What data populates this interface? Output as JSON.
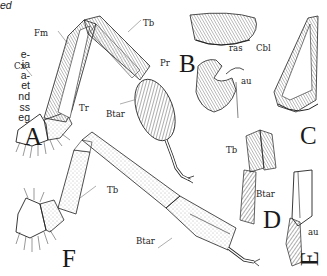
{
  "figure": {
    "side_text_fragments": [
      "ed",
      "",
      "e-",
      "ia",
      "a-",
      "et",
      "nd",
      "ss",
      "eg",
      "al",
      "of"
    ],
    "panels": [
      {
        "id": "A",
        "label": "A"
      },
      {
        "id": "B",
        "label": "B"
      },
      {
        "id": "C",
        "label": "C"
      },
      {
        "id": "D",
        "label": "D"
      },
      {
        "id": "E",
        "label": "E"
      },
      {
        "id": "F",
        "label": "F"
      }
    ],
    "annotations": {
      "A_Fm": "Fm",
      "A_Cx": "Cx",
      "A_Tr": "Tr",
      "A_Tb": "Tb",
      "A_Pr": "Pr",
      "A_Btar": "Btar",
      "B_ras": "ras",
      "B_au": "au",
      "C_Cbl": "Cbl",
      "D_Tb": "Tb",
      "D_Btar": "Btar",
      "E_au": "au",
      "F_Tb": "Tb",
      "F_Btar": "Btar"
    },
    "colors": {
      "ink": "#1a1a1a",
      "paper": "#ffffff",
      "stipple": "#555555"
    }
  }
}
